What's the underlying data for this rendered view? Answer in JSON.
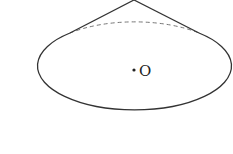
{
  "diagram": {
    "type": "cone",
    "center_label": "O",
    "colors": {
      "stroke": "#333333",
      "dashed": "#777777",
      "background": "#ffffff"
    }
  }
}
